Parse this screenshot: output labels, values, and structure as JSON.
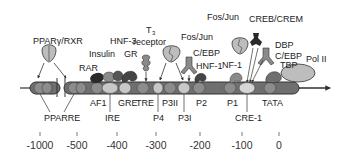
{
  "diagram": {
    "type": "promoter-map",
    "colors": {
      "dna_bar": "#6f6f6f",
      "dna_outline": "#333333",
      "element_mid": "#8c8c8c",
      "element_light": "#c8c8c8",
      "protein_light": "#bdbdbd",
      "protein_mid": "#8a8a8a",
      "protein_dark": "#555555",
      "protein_black": "#2a2a2a"
    },
    "factors": {
      "ppar": "PPARγ/RXR",
      "rar": "RAR",
      "insulin": "Insulin",
      "hnf3": "HNF-3",
      "gr": "GR",
      "t3_line1": "T",
      "t3_sub": "3",
      "t3_line2": "receptor",
      "fosjun1": "Fos/Jun",
      "cebp1": "C/EBP",
      "hnf1": "HNF-1",
      "fosjun2": "Fos/Jun",
      "nf1": "NF-1",
      "creb": "CREB/CREM",
      "dbp": "DBP",
      "cebp2": "C/EBP",
      "tbp": "TBP",
      "pol2": "Pol II"
    },
    "elements": {
      "pparre": "PPARRE",
      "af1": "AF1",
      "ire": "IRE",
      "gre": "GRE",
      "tre": "TRE",
      "p4": "P4",
      "p3ii": "P3II",
      "p3i": "P3I",
      "p2": "P2",
      "p1": "P1",
      "cre1": "CRE-1",
      "tata": "TATA"
    },
    "axis": {
      "ticks": [
        "-1000",
        "-500",
        "-400",
        "-300",
        "-200",
        "-100",
        "0"
      ]
    }
  }
}
